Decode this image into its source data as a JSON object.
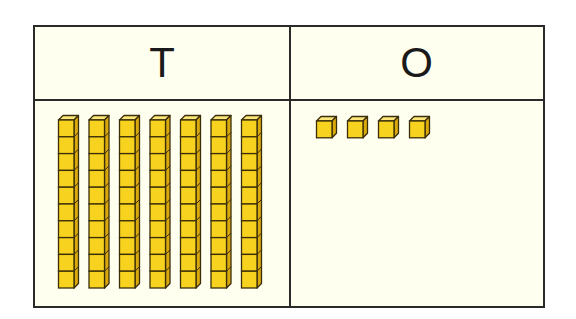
{
  "diagram": {
    "type": "place-value-chart",
    "columns": [
      {
        "key": "tens",
        "label": "T",
        "count": 7,
        "block": "ten-rod",
        "cubes_per_block": 10
      },
      {
        "key": "ones",
        "label": "O",
        "count": 4,
        "block": "unit-cube",
        "cubes_per_block": 1
      }
    ],
    "represented_value": 74,
    "colors": {
      "border": "#2a2a2a",
      "background": "#fffff0",
      "cube_front": "#f7d21e",
      "cube_top": "#fbe67a",
      "cube_side": "#d9a90e",
      "cube_outline": "#3a2e0a"
    }
  }
}
